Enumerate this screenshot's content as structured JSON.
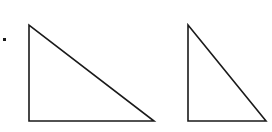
{
  "figure": {
    "background": "#ffffff",
    "stroke_color": "#1a1a1a",
    "bullet": {
      "x": 4,
      "y": 39,
      "size": 3
    },
    "triangles": [
      {
        "name": "left-right-triangle",
        "points": "29,25 29,121 154,121"
      },
      {
        "name": "right-right-triangle",
        "points": "188,25 188,121 266,121"
      }
    ]
  }
}
